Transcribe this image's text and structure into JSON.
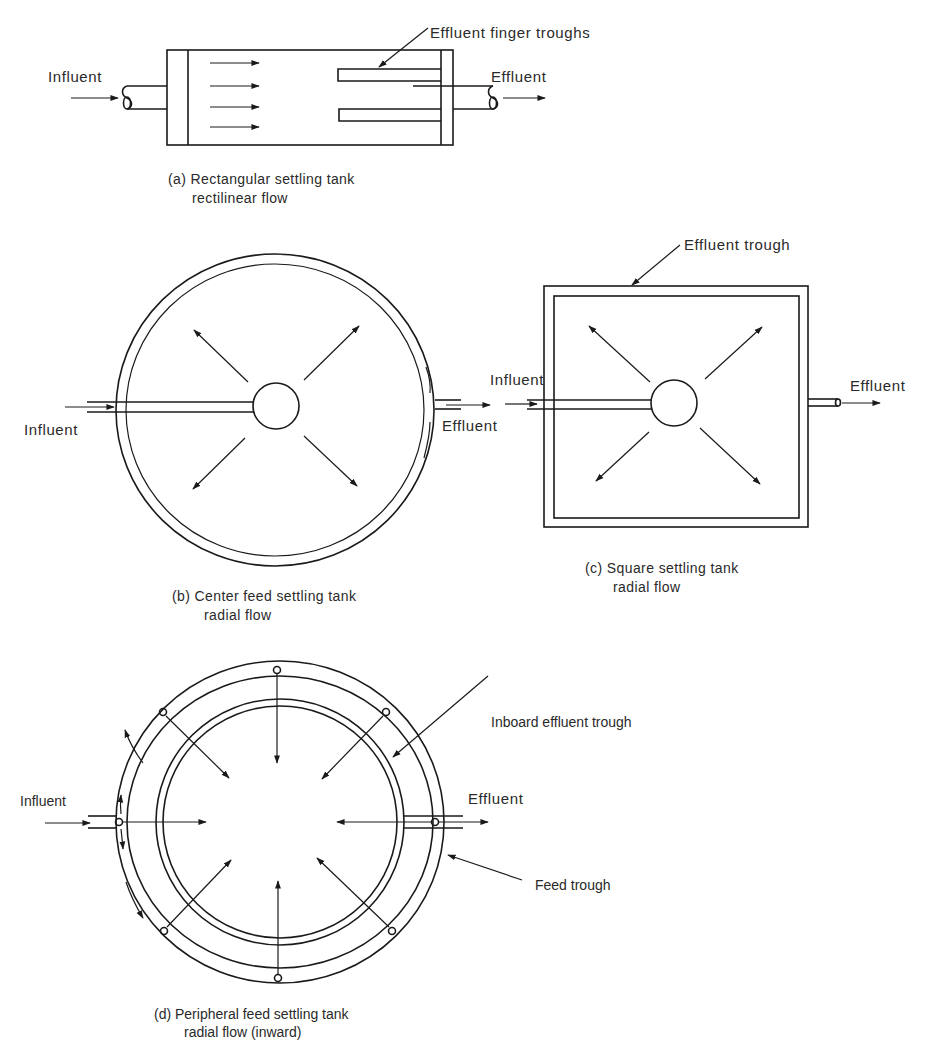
{
  "colors": {
    "ink": "#1a1a1a",
    "text": "#2a2a2a",
    "background": "#ffffff"
  },
  "panel_a": {
    "labels": {
      "influent": "Influent",
      "effluent": "Effluent",
      "troughs": "Effluent finger troughs"
    },
    "caption": {
      "line1": "(a) Rectangular settling tank",
      "line2": "rectilinear flow"
    }
  },
  "panel_b": {
    "labels": {
      "influent": "Influent",
      "effluent": "Effluent"
    },
    "caption": {
      "line1": "(b) Center feed settling tank",
      "line2": "radial flow"
    }
  },
  "panel_c": {
    "labels": {
      "influent": "Influent",
      "effluent": "Effluent",
      "trough": "Effluent trough"
    },
    "caption": {
      "line1": "(c) Square settling tank",
      "line2": "radial flow"
    }
  },
  "panel_d": {
    "labels": {
      "influent": "Influent",
      "effluent": "Effluent",
      "inboard_trough": "Inboard effluent trough",
      "feed_trough": "Feed trough"
    },
    "caption": {
      "line1": "(d) Peripheral feed settling tank",
      "line2": "radial flow (inward)"
    }
  }
}
